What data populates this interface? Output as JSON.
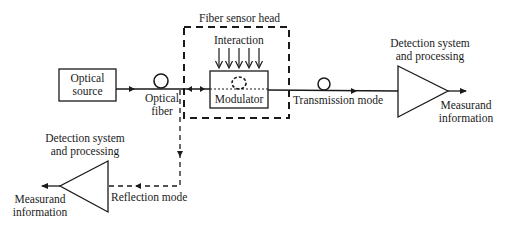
{
  "diagram": {
    "type": "fiber-optic sensor system block diagram",
    "nodes": {
      "optical_source": {
        "label_line1": "Optical",
        "label_line2": "source"
      },
      "optical_fiber": {
        "label_line1": "Optical",
        "label_line2": "fiber"
      },
      "fiber_sensor_head": {
        "label": "Fiber sensor head"
      },
      "interaction": {
        "label": "Interaction"
      },
      "modulator": {
        "label": "Modulator"
      },
      "transmission_mode": {
        "label": "Transmission mode"
      },
      "detection_right": {
        "label_line1": "Detection system",
        "label_line2": "and processing"
      },
      "measurand_right": {
        "label_line1": "Measurand",
        "label_line2": "information"
      },
      "detection_left": {
        "label_line1": "Detection system",
        "label_line2": "and processing"
      },
      "measurand_left": {
        "label_line1": "Measurand",
        "label_line2": "information"
      },
      "reflection_mode": {
        "label": "Reflection mode"
      }
    },
    "edges": [
      {
        "from": "Optical source",
        "to": "Modulator",
        "via": "Optical fiber",
        "style": "solid"
      },
      {
        "from": "Modulator",
        "to": "Detection system and processing (right)",
        "label": "Transmission mode",
        "style": "solid"
      },
      {
        "from": "Detection system and processing (right)",
        "to": "Measurand information (right)",
        "style": "solid"
      },
      {
        "from": "Modulator",
        "to": "Detection system and processing (left)",
        "label": "Reflection mode",
        "style": "dashed"
      },
      {
        "from": "Detection system and processing (left)",
        "to": "Measurand information (left)",
        "style": "solid"
      }
    ],
    "interaction_arrow_count": 5,
    "colors": {
      "stroke": "#1a1a1a",
      "background": "#ffffff"
    }
  }
}
